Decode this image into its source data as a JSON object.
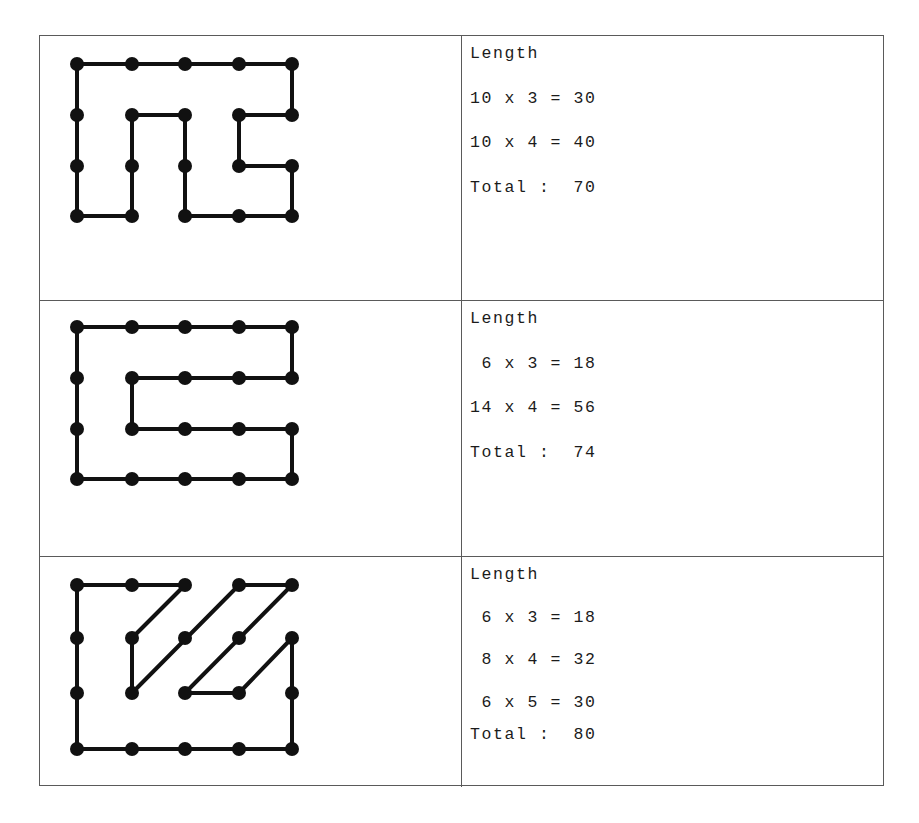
{
  "page": {
    "background": "#ffffff",
    "ink": "#111111",
    "border_color": "#5a5a5a"
  },
  "grid": {
    "columns": 5,
    "rows": 4,
    "col_x": [
      76,
      131,
      184,
      238,
      291
    ],
    "row_y_by_panel": [
      [
        63,
        114,
        165,
        215
      ],
      [
        326,
        377,
        428,
        478
      ],
      [
        584,
        637,
        692,
        748
      ]
    ],
    "dot_radius": 7,
    "line_width": 4
  },
  "rows": [
    {
      "id": "row-1",
      "figure": {
        "name": "figure-1-staircase-shape",
        "segments": [
          {
            "from": [
              1,
              1
            ],
            "to": [
              5,
              1
            ],
            "kind": "horizontal"
          },
          {
            "from": [
              1,
              1
            ],
            "to": [
              1,
              4
            ],
            "kind": "vertical"
          },
          {
            "from": [
              1,
              4
            ],
            "to": [
              2,
              4
            ],
            "kind": "horizontal"
          },
          {
            "from": [
              2,
              2
            ],
            "to": [
              2,
              4
            ],
            "kind": "vertical"
          },
          {
            "from": [
              2,
              2
            ],
            "to": [
              3,
              2
            ],
            "kind": "horizontal"
          },
          {
            "from": [
              3,
              2
            ],
            "to": [
              3,
              4
            ],
            "kind": "vertical"
          },
          {
            "from": [
              3,
              4
            ],
            "to": [
              5,
              4
            ],
            "kind": "horizontal"
          },
          {
            "from": [
              5,
              1
            ],
            "to": [
              5,
              2
            ],
            "kind": "vertical"
          },
          {
            "from": [
              4,
              2
            ],
            "to": [
              5,
              2
            ],
            "kind": "horizontal"
          },
          {
            "from": [
              4,
              2
            ],
            "to": [
              4,
              3
            ],
            "kind": "vertical"
          },
          {
            "from": [
              4,
              3
            ],
            "to": [
              5,
              3
            ],
            "kind": "horizontal"
          },
          {
            "from": [
              5,
              3
            ],
            "to": [
              5,
              4
            ],
            "kind": "vertical"
          }
        ]
      },
      "text": {
        "heading": "Length",
        "lines": [
          "10 x 3 = 30",
          "10 x 4 = 40"
        ],
        "total": "Total :  70"
      },
      "calc": {
        "terms": [
          {
            "unit": 10,
            "count": 3,
            "product": 30
          },
          {
            "unit": 10,
            "count": 4,
            "product": 40
          }
        ],
        "total_value": 70
      }
    },
    {
      "id": "row-2",
      "figure": {
        "name": "figure-2-spiral-c-shape",
        "segments": [
          {
            "from": [
              1,
              1
            ],
            "to": [
              5,
              1
            ],
            "kind": "horizontal"
          },
          {
            "from": [
              5,
              1
            ],
            "to": [
              5,
              2
            ],
            "kind": "vertical"
          },
          {
            "from": [
              2,
              2
            ],
            "to": [
              5,
              2
            ],
            "kind": "horizontal"
          },
          {
            "from": [
              2,
              2
            ],
            "to": [
              2,
              3
            ],
            "kind": "vertical"
          },
          {
            "from": [
              2,
              3
            ],
            "to": [
              5,
              3
            ],
            "kind": "horizontal"
          },
          {
            "from": [
              5,
              3
            ],
            "to": [
              5,
              4
            ],
            "kind": "vertical"
          },
          {
            "from": [
              1,
              1
            ],
            "to": [
              1,
              4
            ],
            "kind": "vertical"
          },
          {
            "from": [
              1,
              4
            ],
            "to": [
              5,
              4
            ],
            "kind": "horizontal"
          }
        ]
      },
      "text": {
        "heading": "Length",
        "lines": [
          " 6 x 3 = 18",
          "14 x 4 = 56"
        ],
        "total": "Total :  74"
      },
      "calc": {
        "terms": [
          {
            "unit": 6,
            "count": 3,
            "product": 18
          },
          {
            "unit": 14,
            "count": 4,
            "product": 56
          }
        ],
        "total_value": 74
      }
    },
    {
      "id": "row-3",
      "figure": {
        "name": "figure-3-zigzag-diagonal-shape",
        "segments": [
          {
            "from": [
              1,
              1
            ],
            "to": [
              3,
              1
            ],
            "kind": "horizontal"
          },
          {
            "from": [
              1,
              1
            ],
            "to": [
              1,
              4
            ],
            "kind": "vertical"
          },
          {
            "from": [
              1,
              4
            ],
            "to": [
              5,
              4
            ],
            "kind": "horizontal"
          },
          {
            "from": [
              3,
              1
            ],
            "to": [
              2,
              2
            ],
            "kind": "diagonal"
          },
          {
            "from": [
              2,
              2
            ],
            "to": [
              2,
              3
            ],
            "kind": "vertical"
          },
          {
            "from": [
              2,
              3
            ],
            "to": [
              4,
              1
            ],
            "kind": "diagonal"
          },
          {
            "from": [
              4,
              1
            ],
            "to": [
              5,
              1
            ],
            "kind": "horizontal"
          },
          {
            "from": [
              5,
              1
            ],
            "to": [
              3,
              3
            ],
            "kind": "diagonal"
          },
          {
            "from": [
              3,
              3
            ],
            "to": [
              4,
              3
            ],
            "kind": "horizontal"
          },
          {
            "from": [
              4,
              3
            ],
            "to": [
              5,
              2
            ],
            "kind": "diagonal"
          },
          {
            "from": [
              5,
              2
            ],
            "to": [
              5,
              4
            ],
            "kind": "vertical"
          }
        ]
      },
      "text": {
        "heading": "Length",
        "lines": [
          " 6 x 3 = 18",
          " 8 x 4 = 32",
          " 6 x 5 = 30"
        ],
        "total": "Total :  80"
      },
      "calc": {
        "terms": [
          {
            "unit": 6,
            "count": 3,
            "product": 18
          },
          {
            "unit": 8,
            "count": 4,
            "product": 32
          },
          {
            "unit": 6,
            "count": 5,
            "product": 30
          }
        ],
        "total_value": 80
      }
    }
  ]
}
